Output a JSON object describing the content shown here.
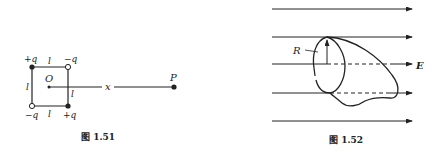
{
  "figure_151": {
    "caption": "图 1.51",
    "charges": {
      "top_left": "+q",
      "top_right": "−q",
      "bottom_left": "−q",
      "bottom_right": "+q"
    },
    "side_labels": {
      "top": "l",
      "left": "l",
      "right": "l",
      "bottom": "l"
    },
    "origin_label": "O",
    "distance_label": "x",
    "point_label": "P"
  },
  "figure_152": {
    "caption": "图 1.52",
    "radius_label": "R",
    "field_label": "E",
    "field_line_count": 5
  },
  "colors": {
    "ink": "#222222",
    "background": "#ffffff"
  }
}
